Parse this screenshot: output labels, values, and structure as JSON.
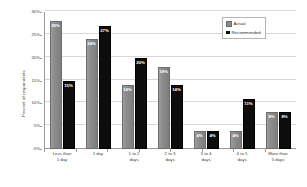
{
  "chart_data": {
    "type": "bar",
    "title": "",
    "xlabel": "",
    "ylabel": "Percent of respondents",
    "ylim": [
      0,
      30
    ],
    "grid": true,
    "legend_position": "top-right",
    "categories": [
      "Less than\n1 day",
      "1 day",
      "1 to 2\ndays",
      "2 to 3\ndays",
      "3 to 4\ndays",
      "4 to 5\ndays",
      "More than\n5 days"
    ],
    "ytick_labels": [
      "0%",
      "5%",
      "10%",
      "15%",
      "20%",
      "25%",
      "30%"
    ],
    "ytick_values": [
      0,
      5,
      10,
      15,
      20,
      25,
      30
    ],
    "series": [
      {
        "name": "Actual",
        "color": "#8c8c8c",
        "values": [
          28,
          24,
          14,
          18,
          4,
          4,
          8
        ],
        "labels": [
          "28%",
          "24%",
          "14%",
          "18%",
          "4%",
          "4%",
          "8%"
        ]
      },
      {
        "name": "Recommended",
        "color": "#0d0d0d",
        "values": [
          15,
          27,
          20,
          14,
          4,
          11,
          8
        ],
        "labels": [
          "15%",
          "27%",
          "20%",
          "14%",
          "4%",
          "11%",
          "8%"
        ]
      }
    ]
  },
  "legend": {
    "items": [
      {
        "label": "Actual"
      },
      {
        "label": "Recommended"
      }
    ]
  },
  "axes": {
    "y_title": "Percent of respondents"
  }
}
